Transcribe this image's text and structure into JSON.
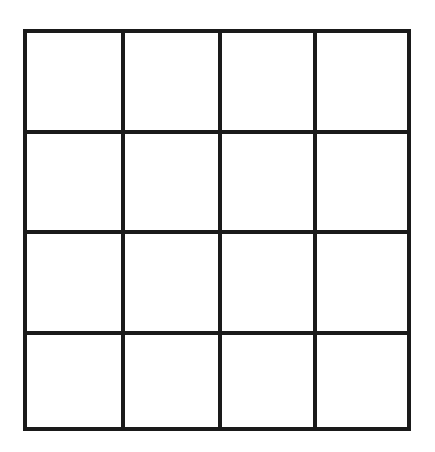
{
  "grid": {
    "rows": 4,
    "cols": 4,
    "line_color": "#1a1a1a",
    "background": "#ffffff"
  }
}
